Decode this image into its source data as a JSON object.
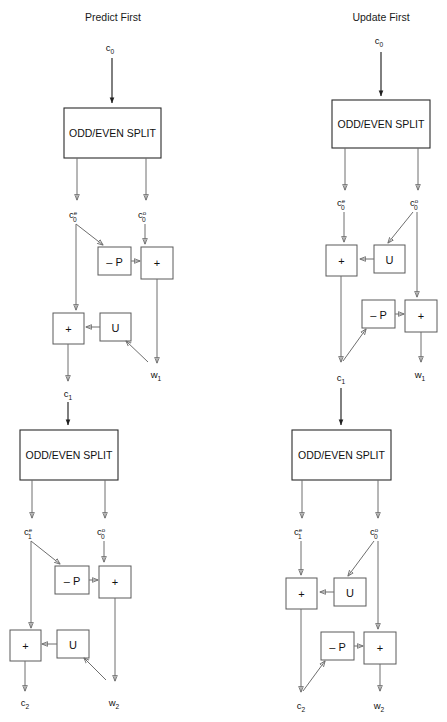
{
  "page": {
    "width": 447,
    "height": 722,
    "background": "#ffffff",
    "line_color": "#6e6e6e",
    "text_color": "#1a1a1a",
    "top_cut_text": "",
    "bottom_cut_text": ""
  },
  "panels": [
    {
      "id": "predict-first",
      "title": "Predict First",
      "title_x": 113,
      "stages": [
        {
          "id": "stage-1",
          "split_label": "ODD/EVEN SPLIT",
          "input_label": "c",
          "input_sub": "0",
          "input_sup": "",
          "even_label": "c",
          "even_sub": "0",
          "even_sup": "e",
          "odd_label": "c",
          "odd_sub": "0",
          "odd_sup": "o",
          "predict_label": "– P",
          "update_label": "U",
          "sum_top_label": "+",
          "sum_bottom_label": "+",
          "out_approx_label": "c",
          "out_approx_sub": "1",
          "out_detail_label": "w",
          "out_detail_sub": "1"
        },
        {
          "id": "stage-2",
          "split_label": "ODD/EVEN SPLIT",
          "even_label": "c",
          "even_sub": "1",
          "even_sup": "e",
          "odd_label": "c",
          "odd_sub": "0",
          "odd_sup": "o",
          "predict_label": "– P",
          "update_label": "U",
          "sum_top_label": "+",
          "sum_bottom_label": "+",
          "out_approx_label": "c",
          "out_approx_sub": "2",
          "out_detail_label": "w",
          "out_detail_sub": "2"
        }
      ]
    },
    {
      "id": "update-first",
      "title": "Update First",
      "title_x": 381,
      "stages": [
        {
          "id": "stage-1",
          "split_label": "ODD/EVEN SPLIT",
          "input_label": "c",
          "input_sub": "0",
          "input_sup": "",
          "even_label": "c",
          "even_sub": "0",
          "even_sup": "e",
          "odd_label": "c",
          "odd_sub": "0",
          "odd_sup": "o",
          "predict_label": "– P",
          "update_label": "U",
          "sum_top_label": "+",
          "sum_bottom_label": "+",
          "out_approx_label": "c",
          "out_approx_sub": "1",
          "out_detail_label": "w",
          "out_detail_sub": "1"
        },
        {
          "id": "stage-2",
          "split_label": "ODD/EVEN SPLIT",
          "even_label": "c",
          "even_sub": "1",
          "even_sup": "e",
          "odd_label": "c",
          "odd_sub": "0",
          "odd_sup": "o",
          "predict_label": "– P",
          "update_label": "U",
          "sum_top_label": "+",
          "sum_bottom_label": "+",
          "out_approx_label": "c",
          "out_approx_sub": "2",
          "out_detail_label": "w",
          "out_detail_sub": "2"
        }
      ]
    }
  ]
}
